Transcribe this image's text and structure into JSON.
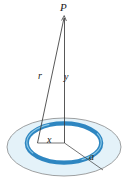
{
  "figure": {
    "labels": {
      "apex_point": "P",
      "slant_distance": "r",
      "axial_distance": "y",
      "inner_radius": "x",
      "outer_radius": "a"
    },
    "colors": {
      "ring_stroke": "#2e86c1",
      "ring_highlight": "#bcdff1",
      "disk_fill": "#e4f2f9",
      "disk_stroke": "#6f6f6f",
      "line_stroke": "#3a3a3a",
      "label_color": "#1a1a1a",
      "background": "#ffffff"
    },
    "geometry": {
      "point_P": {
        "x": 64,
        "y": 17
      },
      "disk_center": {
        "x": 64,
        "y": 147
      },
      "disk_rx": 58,
      "disk_ry": 30,
      "ring_center": {
        "x": 64,
        "y": 143
      },
      "ring_rx": 38,
      "ring_ry": 20,
      "ring_thickness": 4
    }
  }
}
